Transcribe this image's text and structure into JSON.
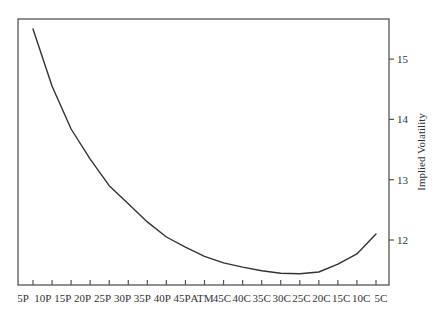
{
  "chart_data": {
    "type": "line",
    "title": "",
    "xlabel": "",
    "ylabel": "Implied Volatility",
    "categories": [
      "5P",
      "10P",
      "15P",
      "20P",
      "25P",
      "30P",
      "35P",
      "40P",
      "45P",
      "ATM",
      "45C",
      "40C",
      "35C",
      "30C",
      "25C",
      "20C",
      "15C",
      "10C",
      "5C"
    ],
    "series": [
      {
        "name": "Implied Volatility",
        "values": [
          15.5,
          14.55,
          13.84,
          13.34,
          12.9,
          12.6,
          12.3,
          12.05,
          11.88,
          11.73,
          11.62,
          11.55,
          11.49,
          11.45,
          11.44,
          11.47,
          11.6,
          11.77,
          12.1
        ]
      }
    ],
    "yticks": [
      12,
      13,
      14,
      15
    ],
    "ylim": [
      11.25,
      15.68
    ],
    "yaxis_position": "right",
    "grid": false,
    "legend": "none",
    "colors": {
      "line": "#333333",
      "frame": "#555555",
      "background": "#ffffff"
    }
  }
}
